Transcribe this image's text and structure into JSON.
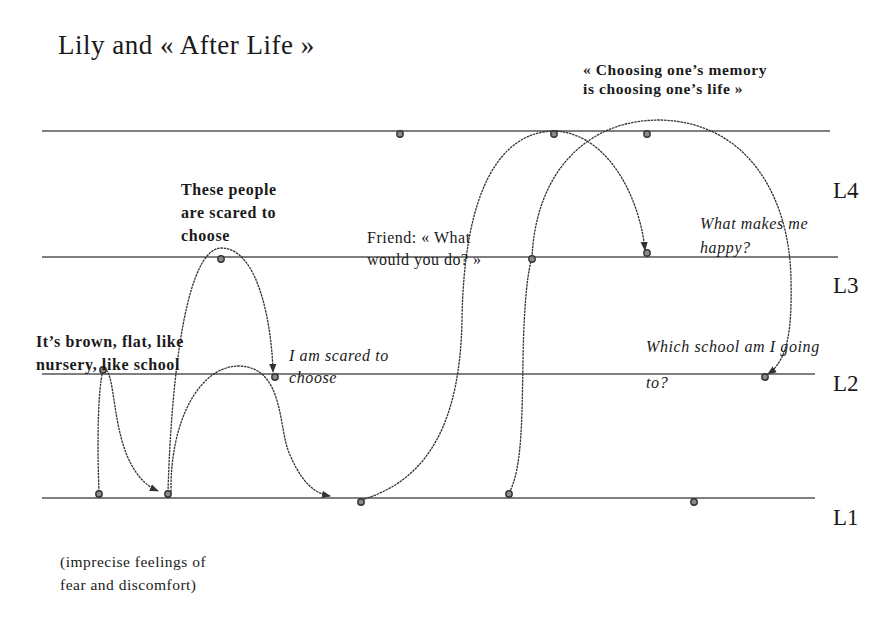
{
  "title": "Lily and « After Life »",
  "quote": {
    "line1": "« Choosing one’s memory",
    "line2": "is choosing one’s life »"
  },
  "levels": [
    {
      "id": "L4",
      "label": "L4",
      "y": 131
    },
    {
      "id": "L3",
      "label": "L3",
      "y": 257
    },
    {
      "id": "L2",
      "label": "L2",
      "y": 374
    },
    {
      "id": "L1",
      "label": "L1",
      "y": 498
    }
  ],
  "annotations": {
    "scared_people": {
      "line1": "These people",
      "line2": "are scared to",
      "line3": "choose"
    },
    "brown_flat": {
      "line1": "It’s brown, flat, like",
      "line2": "nursery, like school"
    },
    "i_am_scared": {
      "line1": "I am scared to",
      "line2": "choose"
    },
    "friend": {
      "line1": "Friend: « What",
      "line2": "would you do? »"
    },
    "what_makes": {
      "line1": "What makes me",
      "line2": "happy?"
    },
    "which_school": {
      "line1": "Which school am I going",
      "line2": "to?"
    },
    "imprecise": {
      "line1": "(imprecise feelings of",
      "line2": "fear and discomfort)"
    }
  },
  "colors": {
    "line": "#555555",
    "curve": "#333333",
    "dot_fill": "#888888",
    "dot_stroke": "#333333",
    "text": "#1a1a1a"
  },
  "points": [
    {
      "level": "L4",
      "x": 400,
      "y": 134
    },
    {
      "level": "L4",
      "x": 554,
      "y": 134
    },
    {
      "level": "L4",
      "x": 647,
      "y": 134
    },
    {
      "level": "L3",
      "x": 221,
      "y": 259
    },
    {
      "level": "L3",
      "x": 532,
      "y": 259
    },
    {
      "level": "L3",
      "x": 647,
      "y": 253
    },
    {
      "level": "L2",
      "x": 103,
      "y": 370
    },
    {
      "level": "L2",
      "x": 275,
      "y": 377
    },
    {
      "level": "L2",
      "x": 765,
      "y": 377
    },
    {
      "level": "L1",
      "x": 99,
      "y": 494
    },
    {
      "level": "L1",
      "x": 168,
      "y": 494
    },
    {
      "level": "L1",
      "x": 361,
      "y": 502
    },
    {
      "level": "L1",
      "x": 509,
      "y": 494
    },
    {
      "level": "L1",
      "x": 694,
      "y": 502
    }
  ]
}
